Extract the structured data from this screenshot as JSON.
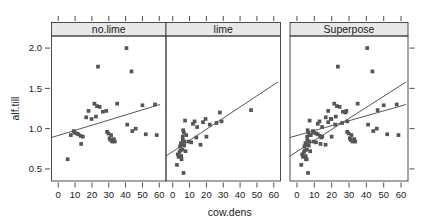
{
  "figure": {
    "type": "trellis-scatter-panels",
    "background_color": "#ffffff",
    "point_color": "#555555",
    "line_color": "#444444",
    "strip_fill": "#e8e8e8",
    "frame_color": "#3a3a3a"
  },
  "axes": {
    "xlabel": "cow.dens",
    "ylabel": "alf.till",
    "xticks": [
      0,
      10,
      20,
      30,
      40,
      50,
      60
    ],
    "xtick_labels": [
      "0",
      "10",
      "20",
      "30",
      "40",
      "50",
      "60"
    ],
    "yticks": [
      0.5,
      1.0,
      1.5,
      2.0
    ],
    "ytick_labels": [
      "0.5",
      "1.0",
      "1.5",
      "2.0"
    ],
    "xlim": [
      -4,
      64
    ],
    "ylim": [
      0.35,
      2.15
    ]
  },
  "panels": [
    {
      "strip_label": "no.lime",
      "strip_name": "strip-no-lime"
    },
    {
      "strip_label": "lime",
      "strip_name": "strip-lime"
    },
    {
      "strip_label": "Superpose",
      "strip_name": "strip-superpose"
    }
  ],
  "chart_data": {
    "type": "scatter",
    "title": "",
    "xlabel": "cow.dens",
    "ylabel": "alf.till",
    "xlim": [
      -4,
      64
    ],
    "ylim": [
      0.35,
      2.15
    ],
    "grid": false,
    "legend_position": "none",
    "panel_layout": "1 row x 3 columns",
    "series": [
      {
        "name": "no.lime",
        "panel": "no.lime",
        "marker": "square",
        "color": "#555555",
        "points": [
          [
            5.6,
            0.62
          ],
          [
            7.5,
            0.92
          ],
          [
            9.2,
            0.97
          ],
          [
            9.8,
            0.95
          ],
          [
            11.0,
            0.94
          ],
          [
            12.0,
            0.93
          ],
          [
            13.3,
            0.91
          ],
          [
            13.6,
            0.81
          ],
          [
            14.6,
            0.9
          ],
          [
            16.6,
            1.14
          ],
          [
            18.0,
            1.22
          ],
          [
            19.8,
            1.12
          ],
          [
            21.5,
            1.31
          ],
          [
            22.4,
            1.15
          ],
          [
            23.0,
            1.28
          ],
          [
            23.6,
            1.77
          ],
          [
            24.6,
            1.27
          ],
          [
            26.5,
            1.21
          ],
          [
            28.5,
            1.22
          ],
          [
            29.0,
            0.96
          ],
          [
            29.8,
            0.94
          ],
          [
            30.5,
            0.88
          ],
          [
            31.0,
            0.86
          ],
          [
            31.4,
            0.92
          ],
          [
            32.0,
            0.84
          ],
          [
            33.0,
            0.87
          ],
          [
            33.6,
            0.84
          ],
          [
            35.0,
            1.31
          ],
          [
            40.5,
            2.0
          ],
          [
            41.0,
            1.05
          ],
          [
            43.5,
            1.71
          ],
          [
            44.0,
            0.97
          ],
          [
            46.0,
            1.0
          ],
          [
            50.0,
            1.29
          ],
          [
            52.0,
            0.93
          ],
          [
            57.5,
            1.3
          ],
          [
            58.5,
            0.92
          ]
        ],
        "fit_line": {
          "x0": -4,
          "y0": 0.89,
          "x1": 60.5,
          "y1": 1.3
        }
      },
      {
        "name": "lime",
        "panel": "lime",
        "marker": "square",
        "color": "#555555",
        "points": [
          [
            2.5,
            0.55
          ],
          [
            3.0,
            0.68
          ],
          [
            3.5,
            0.65
          ],
          [
            4.0,
            0.71
          ],
          [
            4.3,
            0.78
          ],
          [
            4.6,
            0.73
          ],
          [
            4.9,
            0.82
          ],
          [
            5.0,
            0.66
          ],
          [
            5.2,
            0.62
          ],
          [
            5.5,
            0.8
          ],
          [
            5.7,
            0.74
          ],
          [
            5.9,
            0.9
          ],
          [
            6.0,
            0.86
          ],
          [
            6.2,
            0.98
          ],
          [
            6.4,
            0.45
          ],
          [
            6.6,
            0.95
          ],
          [
            6.8,
            0.79
          ],
          [
            7.0,
            0.84
          ],
          [
            7.3,
            1.1
          ],
          [
            7.6,
            0.72
          ],
          [
            8.0,
            0.92
          ],
          [
            9.5,
            0.84
          ],
          [
            11.0,
            0.83
          ],
          [
            12.0,
            1.06
          ],
          [
            13.0,
            1.09
          ],
          [
            14.0,
            0.89
          ],
          [
            14.5,
            1.02
          ],
          [
            16.5,
            0.8
          ],
          [
            18.0,
            1.08
          ],
          [
            19.5,
            1.12
          ],
          [
            20.0,
            0.9
          ],
          [
            22.0,
            1.05
          ],
          [
            26.0,
            1.07
          ],
          [
            28.0,
            1.2
          ],
          [
            29.0,
            1.09
          ],
          [
            46.5,
            1.23
          ]
        ],
        "fit_line": {
          "x0": -4,
          "y0": 0.66,
          "x1": 62.5,
          "y1": 1.58
        }
      },
      {
        "name": "Superpose (all points)",
        "panel": "Superpose",
        "marker": "square",
        "color": "#555555",
        "note": "union of no.lime and lime observations with both fitted lines overlaid",
        "fit_lines": [
          {
            "name": "no.lime-fit",
            "x0": -4,
            "y0": 0.89,
            "x1": 63,
            "y1": 1.3
          },
          {
            "name": "lime-fit",
            "x0": -4,
            "y0": 0.66,
            "x1": 63,
            "y1": 1.58
          }
        ]
      }
    ]
  }
}
